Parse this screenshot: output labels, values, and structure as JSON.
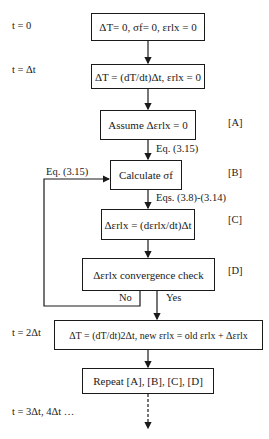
{
  "time_labels": {
    "t0": "t = 0",
    "t1": "t = Δt",
    "t2": "t = 2Δt",
    "t3": "t = 3Δt, 4Δt …"
  },
  "boxes": {
    "init": "ΔT= 0, σf= 0, εrlx = 0",
    "step1": "ΔT = (dT/dt)Δt, εrlx = 0",
    "assume": "Assume Δεrlx = 0",
    "calc": "Calculate σf",
    "delta": "Δεrlx = (dεrlx/dt)Δt",
    "check": "Δεrlx convergence check",
    "step2": "ΔT = (dT/dt)2Δt, new εrlx = old εrlx + Δεrlx",
    "repeat": "Repeat [A], [B], [C], [D]"
  },
  "step_tags": {
    "a": "[A]",
    "b": "[B]",
    "c": "[C]",
    "d": "[D]"
  },
  "edge_labels": {
    "a_to_b": "Eq. (3.15)",
    "loop": "Eq. (3.15)",
    "b_to_c": "Eqs. (3.8)-(3.14)",
    "no": "No",
    "yes": "Yes"
  }
}
